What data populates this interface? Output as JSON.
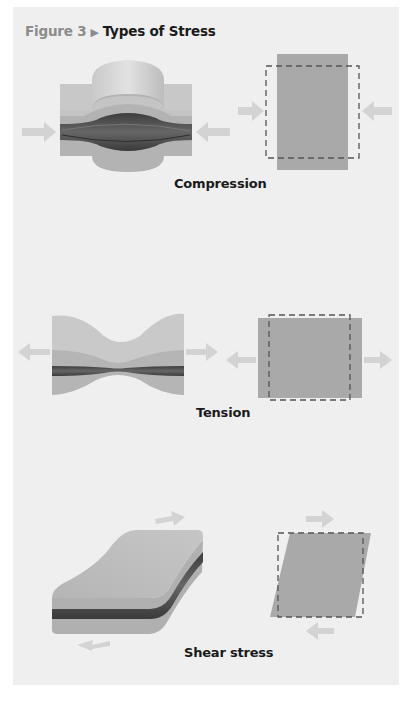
{
  "figure": {
    "number_label": "Figure 3",
    "separator_icon": "right-triangle",
    "title": "Types of Stress"
  },
  "panels": [
    {
      "id": "compression",
      "caption": "Compression"
    },
    {
      "id": "tension",
      "caption": "Tension"
    },
    {
      "id": "shear",
      "caption": "Shear stress"
    }
  ],
  "colors": {
    "background": "#efefef",
    "block_face": "#b9b9b9",
    "square_fill": "#a9a9a9",
    "arrow": "#d6d6d6",
    "dashed_outline": "#555555",
    "rock_layer": "#4a4a4a"
  }
}
